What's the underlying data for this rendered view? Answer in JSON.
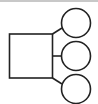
{
  "diagram": {
    "type": "tree",
    "nodes": [
      {
        "id": "parent",
        "shape": "square"
      },
      {
        "id": "child-1",
        "shape": "circle"
      },
      {
        "id": "child-2",
        "shape": "circle"
      },
      {
        "id": "child-3",
        "shape": "circle"
      }
    ],
    "edges": [
      {
        "from": "parent",
        "to": "child-1"
      },
      {
        "from": "parent",
        "to": "child-2"
      },
      {
        "from": "parent",
        "to": "child-3"
      }
    ],
    "colors": {
      "stroke": "#222222",
      "background": "#ffffff",
      "top_border": "#c8c8c8"
    }
  }
}
